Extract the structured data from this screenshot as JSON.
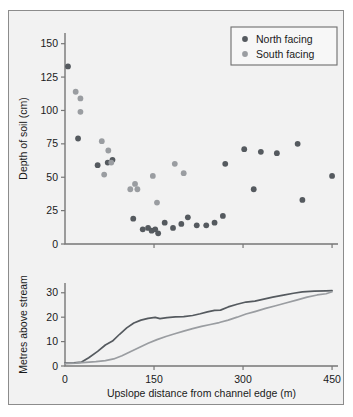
{
  "figure": {
    "background": "#f2f2f2",
    "border_color": "#8c8c8c"
  },
  "legend": {
    "position": "top-right",
    "entries": [
      {
        "label": "North facing",
        "color": "#555a5f"
      },
      {
        "label": "South facing",
        "color": "#9a9da1"
      }
    ]
  },
  "chart_data": [
    {
      "type": "scatter",
      "title": "",
      "xlabel": "",
      "ylabel": "Depth of soil (cm)",
      "xlim": [
        0,
        460
      ],
      "ylim": [
        0,
        158
      ],
      "xticks": [
        0,
        150,
        300,
        450
      ],
      "xticklabels": [
        "",
        "",
        "",
        ""
      ],
      "yticks": [
        0,
        25,
        50,
        75,
        100,
        125,
        150
      ],
      "yticklabels": [
        "0",
        "25",
        "50",
        "75",
        "100",
        "125",
        "150"
      ],
      "grid": false,
      "legend": "top-right",
      "series": [
        {
          "name": "North facing",
          "color": "#555a5f",
          "points": [
            [
              5,
              133
            ],
            [
              22,
              79
            ],
            [
              55,
              59
            ],
            [
              72,
              61
            ],
            [
              80,
              63
            ],
            [
              115,
              19
            ],
            [
              131,
              11
            ],
            [
              140,
              12
            ],
            [
              146,
              10
            ],
            [
              152,
              11
            ],
            [
              157,
              8
            ],
            [
              168,
              16
            ],
            [
              182,
              12
            ],
            [
              196,
              15
            ],
            [
              207,
              20
            ],
            [
              222,
              14
            ],
            [
              238,
              14
            ],
            [
              252,
              16
            ],
            [
              266,
              21
            ],
            [
              270,
              60
            ],
            [
              302,
              71
            ],
            [
              318,
              41
            ],
            [
              330,
              69
            ],
            [
              357,
              68
            ],
            [
              392,
              75
            ],
            [
              400,
              33
            ],
            [
              450,
              51
            ]
          ]
        },
        {
          "name": "South facing",
          "color": "#9a9da1",
          "points": [
            [
              18,
              114
            ],
            [
              26,
              109
            ],
            [
              26,
              99
            ],
            [
              62,
              77
            ],
            [
              73,
              70
            ],
            [
              78,
              61
            ],
            [
              66,
              52
            ],
            [
              110,
              41
            ],
            [
              118,
              45
            ],
            [
              122,
              41
            ],
            [
              148,
              51
            ],
            [
              155,
              31
            ],
            [
              185,
              60
            ],
            [
              200,
              53
            ]
          ]
        }
      ]
    },
    {
      "type": "line",
      "title": "",
      "xlabel": "Upslope distance from channel edge (m)",
      "ylabel": "Metres above stream",
      "xlim": [
        0,
        460
      ],
      "ylim": [
        0,
        34
      ],
      "xticks": [
        0,
        150,
        300,
        450
      ],
      "xticklabels": [
        "0",
        "150",
        "300",
        "450"
      ],
      "yticks": [
        0,
        10,
        20,
        30
      ],
      "yticklabels": [
        "0",
        "10",
        "20",
        "30"
      ],
      "grid": false,
      "series": [
        {
          "name": "North facing",
          "color": "#555a5f",
          "x": [
            0,
            15,
            28,
            40,
            55,
            68,
            80,
            92,
            104,
            116,
            128,
            140,
            152,
            160,
            172,
            186,
            200,
            215,
            228,
            240,
            252,
            262,
            275,
            290,
            305,
            320,
            335,
            350,
            368,
            385,
            400,
            420,
            440,
            450
          ],
          "y": [
            1.2,
            1.3,
            1.6,
            3.4,
            6.0,
            8.6,
            10.2,
            13.0,
            15.6,
            17.6,
            18.8,
            19.5,
            19.9,
            19.4,
            19.8,
            20.1,
            20.2,
            20.7,
            21.4,
            22.2,
            22.8,
            22.9,
            24.2,
            25.3,
            26.2,
            26.6,
            27.4,
            28.2,
            29.0,
            29.8,
            30.4,
            30.7,
            30.8,
            30.9
          ]
        },
        {
          "name": "South facing",
          "color": "#9a9da1",
          "x": [
            0,
            18,
            35,
            52,
            68,
            82,
            96,
            110,
            125,
            140,
            155,
            170,
            185,
            200,
            215,
            230,
            245,
            260,
            275,
            290,
            305,
            320,
            338,
            355,
            372,
            390,
            408,
            425,
            440,
            450
          ],
          "y": [
            1.0,
            1.2,
            1.5,
            1.8,
            2.2,
            2.9,
            4.2,
            5.8,
            7.6,
            9.3,
            10.8,
            12.1,
            13.2,
            14.3,
            15.3,
            16.2,
            17.0,
            17.8,
            18.8,
            20.0,
            21.3,
            22.3,
            23.6,
            24.7,
            25.8,
            27.0,
            28.2,
            29.1,
            29.6,
            30.4
          ]
        }
      ]
    }
  ]
}
